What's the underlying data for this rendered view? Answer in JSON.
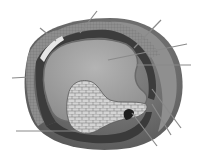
{
  "diagram": {
    "title": "",
    "type": "anatomical cross-section illustration (grayscale)",
    "labels_visible": false,
    "colors": {
      "background": "#ffffff",
      "outer_layer": "#6e6e6e",
      "dark_band": "#3a3a3a",
      "cell_layer": "#9a9a9a",
      "cavity": "#a8a8a8",
      "inner_mass": "#d2d2d2",
      "cell_outline": "#7a7a7a",
      "leader_line": "#8a8a8a"
    },
    "leader_lines": [
      {
        "id": "L1",
        "x1": 40,
        "y1": 28,
        "x2": 56,
        "y2": 41
      },
      {
        "id": "L2",
        "x1": 97,
        "y1": 11,
        "x2": 80,
        "y2": 33
      },
      {
        "id": "L3",
        "x1": 161,
        "y1": 20,
        "x2": 134,
        "y2": 48
      },
      {
        "id": "L4",
        "x1": 187,
        "y1": 44,
        "x2": 108,
        "y2": 60
      },
      {
        "id": "L5",
        "x1": 191,
        "y1": 65,
        "x2": 136,
        "y2": 65
      },
      {
        "id": "L6",
        "x1": 12,
        "y1": 78,
        "x2": 30,
        "y2": 77
      },
      {
        "id": "L7",
        "x1": 16,
        "y1": 131,
        "x2": 78,
        "y2": 131
      },
      {
        "id": "L8",
        "x1": 181,
        "y1": 128,
        "x2": 152,
        "y2": 89
      },
      {
        "id": "L9",
        "x1": 171,
        "y1": 135,
        "x2": 152,
        "y2": 104
      },
      {
        "id": "L10",
        "x1": 157,
        "y1": 146,
        "x2": 132,
        "y2": 113
      }
    ]
  }
}
